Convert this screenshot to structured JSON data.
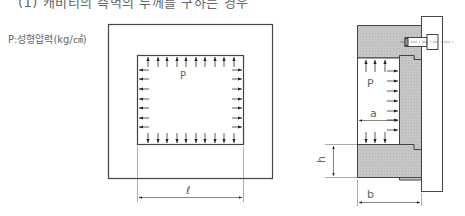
{
  "heading": {
    "text": "(1) 캐비티의 측벽의 두께를 구하는 경우",
    "clipped": true
  },
  "legend": {
    "pressure_label": "P:성형압력(kg/㎠)"
  },
  "left_figure": {
    "title": "plan-view",
    "pressure_symbol": "P",
    "dimension_label": "ℓ",
    "arrows_top": 10,
    "arrows_bottom": 10,
    "arrows_left": 9,
    "arrows_right": 9
  },
  "right_figure": {
    "title": "section-view",
    "pressure_symbol": "P",
    "dimension_a": "a",
    "dimension_h": "h",
    "dimension_b": "b"
  },
  "colors": {
    "line": "#444444",
    "hatch_fill": "#c8c8c8",
    "dim_line": "#777777"
  }
}
